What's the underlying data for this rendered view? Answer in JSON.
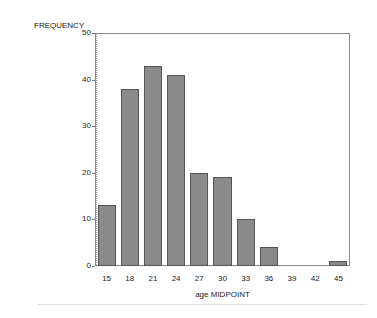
{
  "chart_data": {
    "type": "bar",
    "title": "",
    "ylabel": "FREQUENCY",
    "xlabel": "age MIDPOINT",
    "categories": [
      "15",
      "18",
      "21",
      "24",
      "27",
      "30",
      "33",
      "36",
      "39",
      "42",
      "45"
    ],
    "values": [
      13,
      38,
      43,
      41,
      20,
      19,
      10,
      4,
      0,
      0,
      1
    ],
    "ylim": [
      0,
      50
    ],
    "yticks": [
      "0",
      "10",
      "20",
      "30",
      "40",
      "50"
    ],
    "grid": false,
    "legend": "none",
    "bar_color": "#8a8a8a"
  }
}
